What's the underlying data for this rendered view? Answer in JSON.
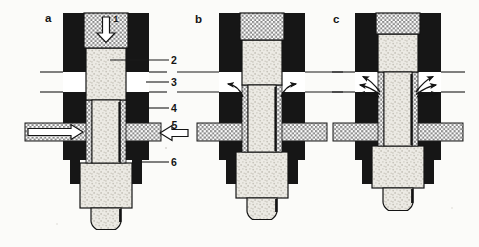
{
  "figure": {
    "panel_labels": {
      "a": "a",
      "b": "b",
      "c": "c"
    },
    "part_labels": {
      "p1": "1",
      "p2": "2",
      "p3": "3",
      "p4": "4",
      "p5": "5",
      "p6": "6"
    },
    "colors": {
      "housing": "#161616",
      "line": "#1a1a1a",
      "piston": "#ebe9e3",
      "pattern_gray": "#8a8a8a",
      "background": "#fbfbf9"
    }
  }
}
